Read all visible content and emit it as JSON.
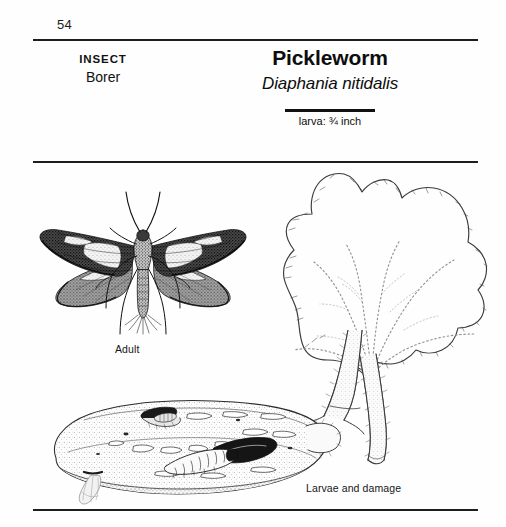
{
  "page": {
    "number": "54",
    "background_color": "#fefefe",
    "ink_color": "#1d1d1d"
  },
  "category": {
    "kicker": "INSECT",
    "name": "Borer"
  },
  "title": {
    "common_name": "Pickleworm",
    "latin_name": "Diaphania nitidalis",
    "scale_label": "larva: ¾ inch"
  },
  "figures": {
    "adult_caption": "Adult",
    "larvae_caption": "Larvae and damage",
    "moth_name": "adult-moth-illustration",
    "leaf_name": "cucurbit-leaf-illustration",
    "stem_name": "plant-stem-illustration",
    "fruit_name": "cucumber-with-larvae-illustration"
  }
}
